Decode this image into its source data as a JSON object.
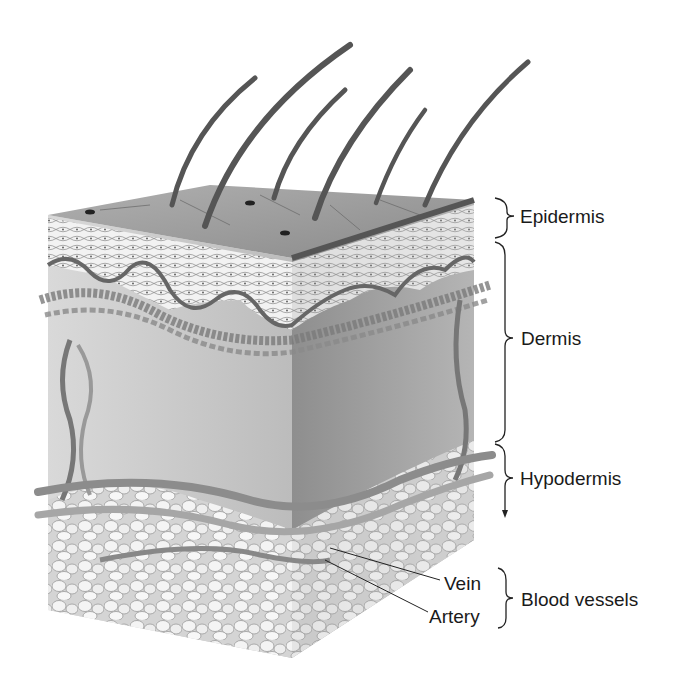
{
  "labels": {
    "epidermis": "Epidermis",
    "dermis": "Dermis",
    "hypodermis": "Hypodermis",
    "vein": "Vein",
    "artery": "Artery",
    "blood_vessels": "Blood vessels"
  },
  "colors": {
    "ink": "#1a1a1a",
    "surface": "#9a9a9a",
    "dermis_front": "#c8c8c8",
    "dermis_side": "#9c9c9c",
    "fat": "#e6e6e6"
  }
}
